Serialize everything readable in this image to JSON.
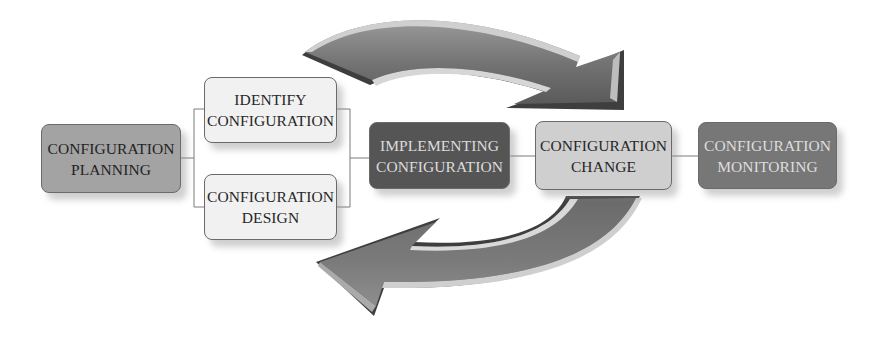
{
  "diagram": {
    "type": "configuration-management-process-flow",
    "nodes": [
      {
        "id": "planning",
        "lines": [
          "CONFIGURATION",
          "PLANNING"
        ],
        "fill": "#a3a3a3"
      },
      {
        "id": "identify",
        "lines": [
          "IDENTIFY",
          "CONFIGURATION"
        ],
        "fill": "#f1f1f1"
      },
      {
        "id": "design",
        "lines": [
          "CONFIGURATION",
          "DESIGN"
        ],
        "fill": "#f1f1f1"
      },
      {
        "id": "implementing",
        "lines": [
          "IMPLEMENTING",
          "CONFIGURATION"
        ],
        "fill": "#555555"
      },
      {
        "id": "change",
        "lines": [
          "CONFIGURATION",
          "CHANGE"
        ],
        "fill": "#cfcfcf"
      },
      {
        "id": "monitoring",
        "lines": [
          "CONFIGURATION",
          "MONITORING"
        ],
        "fill": "#777777"
      }
    ],
    "edges": [
      {
        "from": "planning",
        "to": [
          "identify",
          "design"
        ],
        "style": "bracket"
      },
      {
        "from": [
          "identify",
          "design"
        ],
        "to": "implementing",
        "style": "bracket"
      },
      {
        "from": "implementing",
        "to": "change",
        "style": "line"
      },
      {
        "from": "change",
        "to": "monitoring",
        "style": "line"
      }
    ],
    "arrows": [
      {
        "id": "top-arrow",
        "direction": "left-to-right",
        "description": "curved arrow over the flow pointing down into CONFIGURATION CHANGE",
        "color": "#6e6e6e"
      },
      {
        "id": "bottom-arrow",
        "direction": "right-to-left",
        "description": "curved arrow under the flow from CONFIGURATION CHANGE back toward the left",
        "color": "#6e6e6e"
      }
    ]
  }
}
